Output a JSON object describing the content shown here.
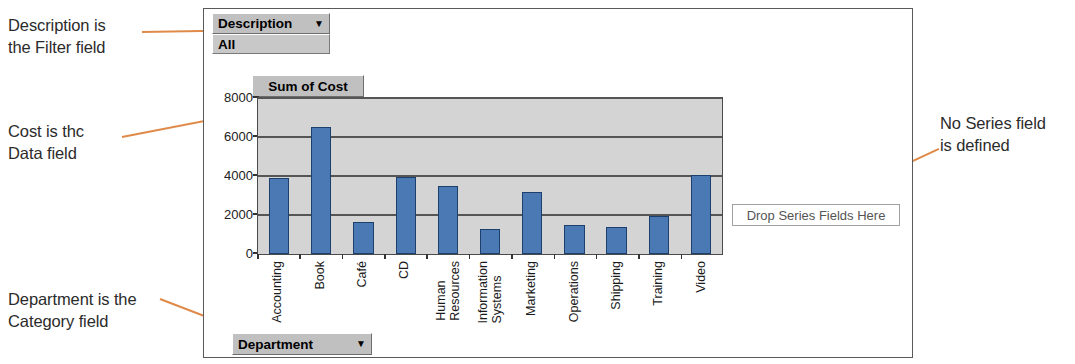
{
  "annotations": [
    {
      "id": "filter",
      "text": "Description is\nthe Filter field"
    },
    {
      "id": "data",
      "text": "Cost is thc\nData field"
    },
    {
      "id": "category",
      "text": "Department is the\nCategory field"
    },
    {
      "id": "series",
      "text": "No Series field\nis defined"
    }
  ],
  "chart_control": {
    "filter_field_label": "Description",
    "filter_field_caret": "▼",
    "filter_value": "All",
    "data_field_label": "Sum of Cost",
    "category_field_label": "Department",
    "category_field_caret": "▼",
    "series_drop_zone_label": "Drop Series Fields Here"
  },
  "colors": {
    "bar_fill": "#4a79b4",
    "bar_outline": "#1c3f6e",
    "plot_background": "#d4d4d4",
    "button_face": "#c0c0c0",
    "leader_line": "#e08a4a"
  },
  "chart_data": {
    "type": "bar",
    "title": "Sum of Cost",
    "xlabel": "Department",
    "ylabel": "",
    "categories": [
      "Accounting",
      "Book",
      "Café",
      "CD",
      "Human Resources",
      "Information Systems",
      "Marketing",
      "Operations",
      "Shipping",
      "Training",
      "Video"
    ],
    "values": [
      3900,
      6500,
      1650,
      3950,
      3500,
      1300,
      3200,
      1500,
      1400,
      1950,
      4050
    ],
    "ylim": [
      0,
      8000
    ],
    "yticks": [
      0,
      2000,
      4000,
      6000,
      8000
    ],
    "ytick_labels": [
      "0",
      "2000",
      "4000",
      "6000",
      "8000"
    ],
    "grid": true,
    "legend": false,
    "series": [
      {
        "name": "Sum of Cost",
        "values": [
          3900,
          6500,
          1650,
          3950,
          3500,
          1300,
          3200,
          1500,
          1400,
          1950,
          4050
        ]
      }
    ]
  }
}
